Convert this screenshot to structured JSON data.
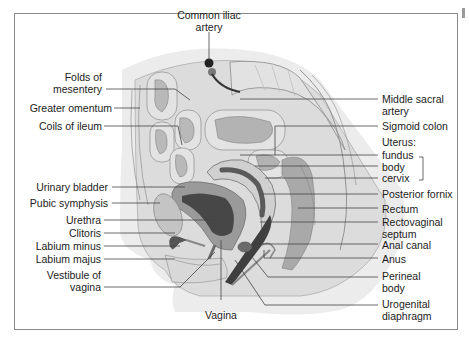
{
  "figure": {
    "colors": {
      "frame": "#8a8a8a",
      "skin": "#e9e9e9",
      "tissue": "#d6d6d6",
      "organ_mid": "#a9a9a9",
      "organ_dark": "#4a4a4a",
      "leader": "#444444"
    },
    "labels_left": [
      {
        "id": "folds-of-mesentery",
        "lines": [
          "Folds of",
          "mesentery"
        ]
      },
      {
        "id": "greater-omentum",
        "lines": [
          "Greater omentum"
        ]
      },
      {
        "id": "coils-of-ileum",
        "lines": [
          "Coils of ileum"
        ]
      },
      {
        "id": "urinary-bladder",
        "lines": [
          "Urinary bladder"
        ]
      },
      {
        "id": "pubic-symphysis",
        "lines": [
          "Pubic symphysis"
        ]
      },
      {
        "id": "urethra",
        "lines": [
          "Urethra"
        ]
      },
      {
        "id": "clitoris",
        "lines": [
          "Clitoris"
        ]
      },
      {
        "id": "labium-minus",
        "lines": [
          "Labium minus"
        ]
      },
      {
        "id": "labium-majus",
        "lines": [
          "Labium majus"
        ]
      },
      {
        "id": "vestibule-of-vagina",
        "lines": [
          "Vestibule of",
          "vagina"
        ]
      }
    ],
    "labels_top": [
      {
        "id": "common-iliac-artery",
        "lines": [
          "Common iliac",
          "artery"
        ]
      }
    ],
    "labels_bottom": [
      {
        "id": "vagina",
        "lines": [
          "Vagina"
        ]
      }
    ],
    "labels_right": [
      {
        "id": "middle-sacral-artery",
        "lines": [
          "Middle sacral",
          "artery"
        ]
      },
      {
        "id": "sigmoid-colon",
        "lines": [
          "Sigmoid colon"
        ]
      },
      {
        "id": "uterus",
        "lines": [
          "Uterus:"
        ]
      },
      {
        "id": "uterus-fundus",
        "lines": [
          "fundus"
        ]
      },
      {
        "id": "uterus-body",
        "lines": [
          "body"
        ]
      },
      {
        "id": "uterus-cervix",
        "lines": [
          "cervix"
        ]
      },
      {
        "id": "posterior-fornix",
        "lines": [
          "Posterior fornix"
        ]
      },
      {
        "id": "rectum",
        "lines": [
          "Rectum"
        ]
      },
      {
        "id": "rectovaginal-septum",
        "lines": [
          "Rectovaginal",
          "septum"
        ]
      },
      {
        "id": "anal-canal",
        "lines": [
          "Anal canal"
        ]
      },
      {
        "id": "anus",
        "lines": [
          "Anus"
        ]
      },
      {
        "id": "perineal-body",
        "lines": [
          "Perineal",
          "body"
        ]
      },
      {
        "id": "urogenital-diaphragm",
        "lines": [
          "Urogenital",
          "diaphragm"
        ]
      }
    ]
  }
}
